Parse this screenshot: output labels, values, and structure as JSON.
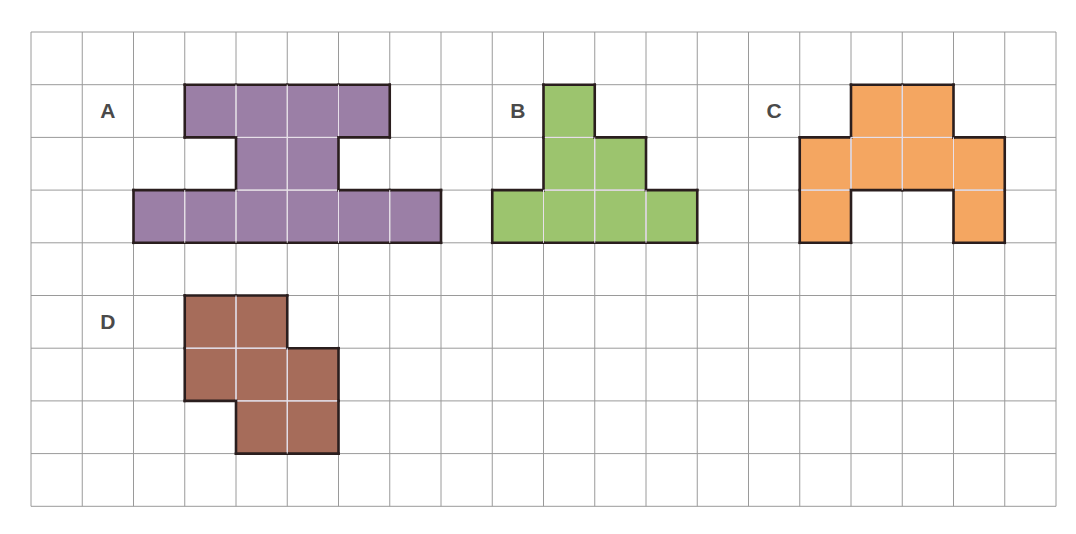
{
  "grid": {
    "columns": 20,
    "rows": 9,
    "cell_width": 51.25,
    "cell_height": 52.7,
    "line_color": "#9a9a9a"
  },
  "shapes": [
    {
      "label": "A",
      "label_cell": [
        1,
        1
      ],
      "fill": "#9b7fa6",
      "cells": [
        [
          3,
          1
        ],
        [
          4,
          1
        ],
        [
          5,
          1
        ],
        [
          6,
          1
        ],
        [
          4,
          2
        ],
        [
          5,
          2
        ],
        [
          2,
          3
        ],
        [
          3,
          3
        ],
        [
          4,
          3
        ],
        [
          5,
          3
        ],
        [
          6,
          3
        ],
        [
          7,
          3
        ]
      ]
    },
    {
      "label": "B",
      "label_cell": [
        9,
        1
      ],
      "fill": "#9cc46e",
      "cells": [
        [
          10,
          1
        ],
        [
          10,
          2
        ],
        [
          11,
          2
        ],
        [
          9,
          3
        ],
        [
          10,
          3
        ],
        [
          11,
          3
        ],
        [
          12,
          3
        ]
      ]
    },
    {
      "label": "C",
      "label_cell": [
        14,
        1
      ],
      "fill": "#f4a661",
      "cells": [
        [
          16,
          1
        ],
        [
          17,
          1
        ],
        [
          15,
          2
        ],
        [
          16,
          2
        ],
        [
          17,
          2
        ],
        [
          18,
          2
        ],
        [
          15,
          3
        ],
        [
          18,
          3
        ]
      ]
    },
    {
      "label": "D",
      "label_cell": [
        1,
        5
      ],
      "fill": "#a66c5a",
      "cells": [
        [
          3,
          5
        ],
        [
          4,
          5
        ],
        [
          3,
          6
        ],
        [
          4,
          6
        ],
        [
          5,
          6
        ],
        [
          4,
          7
        ],
        [
          5,
          7
        ]
      ]
    }
  ]
}
